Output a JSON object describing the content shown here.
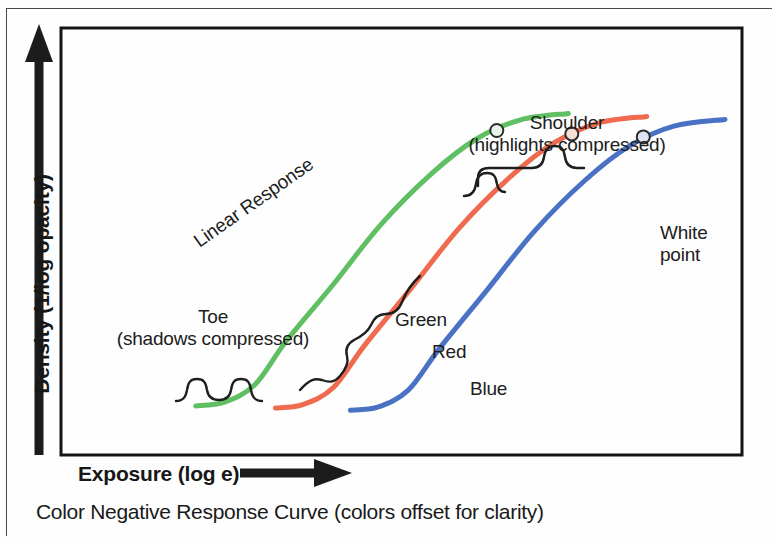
{
  "figure": {
    "caption": "Color Negative Response Curve (colors offset for clarity)"
  },
  "axes": {
    "y_label": "Density (1/log opacity)",
    "x_label": "Exposure (log e)",
    "y_arrow_icon": "up-arrow-icon",
    "x_arrow_icon": "right-arrow-icon"
  },
  "annotations": {
    "shoulder_line1": "Shoulder",
    "shoulder_line2": "(highlights compressed)",
    "toe_line1": "Toe",
    "toe_line2": "(shadows compressed)",
    "linear": "Linear Response",
    "white_point_line1": "White",
    "white_point_line2": "point"
  },
  "curve_labels": {
    "green": "Green",
    "red": "Red",
    "blue": "Blue"
  },
  "colors": {
    "green": "#5fbf62",
    "red": "#ef6a4e",
    "blue": "#4a72c4",
    "axis": "#111111",
    "annotation": "#202020",
    "background": "#fefefe"
  },
  "chart_data": {
    "type": "line",
    "title": "Color Negative Response Curve (colors offset for clarity)",
    "xlabel": "Exposure (log e)",
    "ylabel": "Density (1/log opacity)",
    "xlim": [
      0,
      1
    ],
    "ylim": [
      0,
      1
    ],
    "grid": false,
    "legend": "inline-curve-labels",
    "axis_ticks": [],
    "note": "Characteristic S-shaped (D-log E) sensitometric curves for the three color-negative emulsion layers; curves are horizontally offset for clarity. Each curve has a toe (shadow compression), a straight-line linear response section, and a shoulder (highlight compression), terminating at a marked white point.",
    "series": [
      {
        "name": "Green",
        "color": "#5fbf62",
        "points": [
          {
            "x": 0.198,
            "y": 0.115
          },
          {
            "x": 0.24,
            "y": 0.124
          },
          {
            "x": 0.285,
            "y": 0.165
          },
          {
            "x": 0.33,
            "y": 0.265
          },
          {
            "x": 0.4,
            "y": 0.4
          },
          {
            "x": 0.47,
            "y": 0.54
          },
          {
            "x": 0.545,
            "y": 0.66
          },
          {
            "x": 0.61,
            "y": 0.74
          },
          {
            "x": 0.675,
            "y": 0.785
          },
          {
            "x": 0.745,
            "y": 0.8
          }
        ],
        "white_point": {
          "x": 0.64,
          "y": 0.76
        }
      },
      {
        "name": "Red",
        "color": "#ef6a4e",
        "points": [
          {
            "x": 0.315,
            "y": 0.11
          },
          {
            "x": 0.355,
            "y": 0.118
          },
          {
            "x": 0.4,
            "y": 0.158
          },
          {
            "x": 0.445,
            "y": 0.255
          },
          {
            "x": 0.515,
            "y": 0.392
          },
          {
            "x": 0.585,
            "y": 0.532
          },
          {
            "x": 0.66,
            "y": 0.652
          },
          {
            "x": 0.725,
            "y": 0.732
          },
          {
            "x": 0.79,
            "y": 0.778
          },
          {
            "x": 0.86,
            "y": 0.793
          }
        ],
        "white_point": {
          "x": 0.75,
          "y": 0.752
        }
      },
      {
        "name": "Blue",
        "color": "#4a72c4",
        "points": [
          {
            "x": 0.425,
            "y": 0.105
          },
          {
            "x": 0.465,
            "y": 0.112
          },
          {
            "x": 0.51,
            "y": 0.152
          },
          {
            "x": 0.555,
            "y": 0.248
          },
          {
            "x": 0.625,
            "y": 0.385
          },
          {
            "x": 0.695,
            "y": 0.524
          },
          {
            "x": 0.77,
            "y": 0.644
          },
          {
            "x": 0.835,
            "y": 0.724
          },
          {
            "x": 0.9,
            "y": 0.77
          },
          {
            "x": 0.975,
            "y": 0.786
          }
        ],
        "white_point": {
          "x": 0.855,
          "y": 0.745
        }
      }
    ],
    "regions": [
      {
        "name": "Toe",
        "description": "shadows compressed",
        "x_range": [
          0.2,
          0.33
        ]
      },
      {
        "name": "Linear Response",
        "description": "straight-line portion",
        "x_range": [
          0.33,
          0.52
        ]
      },
      {
        "name": "Shoulder",
        "description": "highlights compressed",
        "x_range": [
          0.52,
          0.7
        ]
      }
    ]
  }
}
